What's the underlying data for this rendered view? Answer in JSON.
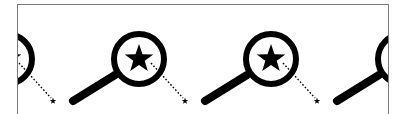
{
  "pattern": {
    "description": "Repeating tiled pattern of magnifying glass icons with stars",
    "motif": "magnifying-glass-with-star",
    "spacing_px": 132,
    "instances": [
      {
        "circle_cx": 6,
        "circle_cy": 58,
        "small_star_x": 52,
        "small_star_y": 100
      },
      {
        "circle_cx": 138,
        "circle_cy": 58,
        "small_star_x": 184,
        "small_star_y": 100
      },
      {
        "circle_cx": 270,
        "circle_cy": 58,
        "small_star_x": 316,
        "small_star_y": 100
      },
      {
        "circle_cx": 402,
        "circle_cy": 58,
        "small_star_x": 448,
        "small_star_y": 100
      }
    ],
    "colors": {
      "icon": "#000000",
      "background": "#ffffff",
      "frame_border": "#7a7a7a"
    }
  }
}
